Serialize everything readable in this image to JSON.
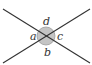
{
  "diagram": {
    "type": "intersecting-lines-angles",
    "colors": {
      "line": "#333333",
      "circle_fill": "#c4c4c4",
      "circle_stroke": "#9a9a9a",
      "label": "#333333"
    },
    "labels": {
      "top": "d",
      "left": "a",
      "right": "c",
      "bottom": "b"
    }
  }
}
